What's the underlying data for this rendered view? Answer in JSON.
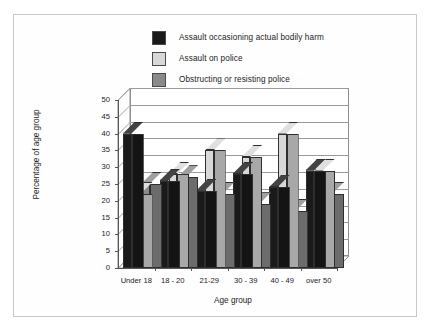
{
  "chart_data": {
    "type": "bar",
    "title": "",
    "xlabel": "Age group",
    "ylabel": "Percentage of age group",
    "categories": [
      "Under 18",
      "18 - 20",
      "21-29",
      "30 - 39",
      "40 - 49",
      "over 50"
    ],
    "series": [
      {
        "name": "Assault occasioning actual bodily harm",
        "color": "#1a1a1a",
        "values": [
          40,
          26,
          23,
          28,
          24,
          29
        ]
      },
      {
        "name": "Assault on police",
        "color": "#d8d8d8",
        "values": [
          22,
          28,
          35,
          33,
          40,
          29
        ]
      },
      {
        "name": "Obstructing or resisting police",
        "color": "#8a8a8a",
        "values": [
          25,
          27,
          22,
          19,
          17,
          22
        ]
      }
    ],
    "ylim": [
      0,
      50
    ],
    "ytick_labels": [
      "0",
      "5",
      "10",
      "15",
      "20",
      "25",
      "30",
      "35",
      "40",
      "45",
      "50"
    ],
    "ytick_values": [
      0,
      5,
      10,
      15,
      20,
      25,
      30,
      35,
      40,
      45,
      50
    ],
    "grid": true,
    "legend_position": "top-center",
    "style": "3d-bar"
  },
  "legend": {
    "items": [
      {
        "label": "Assault occasioning actual bodily harm",
        "color": "#1a1a1a"
      },
      {
        "label": "Assault on police",
        "color": "#d8d8d8"
      },
      {
        "label": "Obstructing or resisting police",
        "color": "#8a8a8a"
      }
    ]
  },
  "axes": {
    "x_title": "Age group",
    "y_title": "Percentage of age group"
  }
}
